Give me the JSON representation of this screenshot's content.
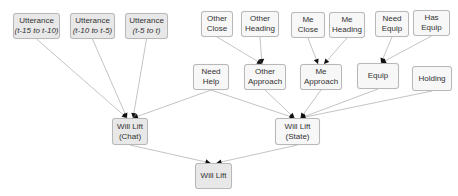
{
  "diagram": {
    "nodes": [
      {
        "id": "utt1",
        "line1": "Utterance",
        "line2": "(t-15 to t-10)",
        "italic2": true,
        "x": 13,
        "y": 13,
        "w": 47,
        "h": 26,
        "fill": "gray"
      },
      {
        "id": "utt2",
        "line1": "Utterance",
        "line2": "(t-10 to t-5)",
        "italic2": true,
        "x": 70,
        "y": 13,
        "w": 45,
        "h": 26,
        "fill": "gray"
      },
      {
        "id": "utt3",
        "line1": "Utterance",
        "line2": "(t-5 to t)",
        "italic2": true,
        "x": 125,
        "y": 13,
        "w": 43,
        "h": 26,
        "fill": "gray"
      },
      {
        "id": "other_close",
        "line1": "Other",
        "line2": "Close",
        "x": 201,
        "y": 11,
        "w": 32,
        "h": 26,
        "fill": "white"
      },
      {
        "id": "other_heading",
        "line1": "Other",
        "line2": "Heading",
        "x": 241,
        "y": 11,
        "w": 38,
        "h": 26,
        "fill": "white"
      },
      {
        "id": "me_close",
        "line1": "Me",
        "line2": "Close",
        "x": 291,
        "y": 12,
        "w": 34,
        "h": 26,
        "fill": "white"
      },
      {
        "id": "me_heading",
        "line1": "Me",
        "line2": "Heading",
        "x": 329,
        "y": 12,
        "w": 36,
        "h": 26,
        "fill": "white"
      },
      {
        "id": "need_equip",
        "line1": "Need",
        "line2": "Equip",
        "x": 375,
        "y": 11,
        "w": 34,
        "h": 26,
        "fill": "white"
      },
      {
        "id": "has_equip",
        "line1": "Has",
        "line2": "Equip",
        "x": 413,
        "y": 10,
        "w": 37,
        "h": 26,
        "fill": "white"
      },
      {
        "id": "need_help",
        "line1": "Need",
        "line2": "Help",
        "x": 193,
        "y": 64,
        "w": 36,
        "h": 26,
        "fill": "white"
      },
      {
        "id": "other_approach",
        "line1": "Other",
        "line2": "Approach",
        "x": 244,
        "y": 64,
        "w": 42,
        "h": 26,
        "fill": "white"
      },
      {
        "id": "me_approach",
        "line1": "Me",
        "line2": "Approach",
        "x": 300,
        "y": 64,
        "w": 42,
        "h": 26,
        "fill": "white"
      },
      {
        "id": "equip",
        "line1": "Equip",
        "line2": "",
        "x": 357,
        "y": 63,
        "w": 42,
        "h": 26,
        "fill": "white"
      },
      {
        "id": "holding",
        "line1": "Holding",
        "line2": "",
        "x": 412,
        "y": 66,
        "w": 40,
        "h": 25,
        "fill": "white"
      },
      {
        "id": "will_lift_chat",
        "line1": "Will Lift",
        "line2": "(Chat)",
        "x": 112,
        "y": 118,
        "w": 36,
        "h": 27,
        "fill": "gray"
      },
      {
        "id": "will_lift_state",
        "line1": "Will Lift",
        "line2": "(State)",
        "x": 275,
        "y": 118,
        "w": 45,
        "h": 27,
        "fill": "white"
      },
      {
        "id": "will_lift",
        "line1": "Will Lift",
        "line2": "",
        "x": 195,
        "y": 163,
        "w": 37,
        "h": 26,
        "fill": "gray"
      }
    ],
    "edges": [
      {
        "from": "utt1",
        "to": "will_lift_chat"
      },
      {
        "from": "utt2",
        "to": "will_lift_chat"
      },
      {
        "from": "utt3",
        "to": "will_lift_chat"
      },
      {
        "from": "need_help",
        "to": "will_lift_chat"
      },
      {
        "from": "other_close",
        "to": "other_approach"
      },
      {
        "from": "other_heading",
        "to": "other_approach"
      },
      {
        "from": "me_close",
        "to": "me_approach"
      },
      {
        "from": "me_heading",
        "to": "me_approach"
      },
      {
        "from": "need_equip",
        "to": "equip"
      },
      {
        "from": "has_equip",
        "to": "equip"
      },
      {
        "from": "need_help",
        "to": "will_lift_state"
      },
      {
        "from": "other_approach",
        "to": "will_lift_state"
      },
      {
        "from": "me_approach",
        "to": "will_lift_state"
      },
      {
        "from": "equip",
        "to": "will_lift_state"
      },
      {
        "from": "holding",
        "to": "will_lift_state"
      },
      {
        "from": "will_lift_chat",
        "to": "will_lift"
      },
      {
        "from": "will_lift_state",
        "to": "will_lift"
      }
    ],
    "colors": {
      "edge": "#c4c4c4",
      "arrow": "#111111",
      "gray_fill": "#e8e8e8",
      "white_fill": "#f7f7f7",
      "border": "#b8b8b8"
    }
  }
}
